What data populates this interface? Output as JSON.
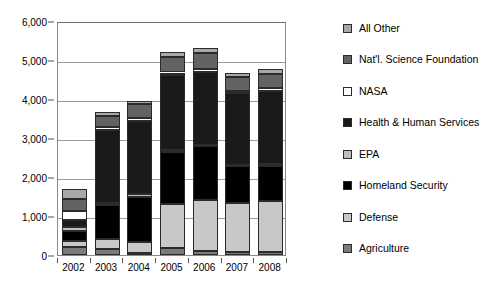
{
  "chart_data": {
    "type": "bar",
    "stacked": true,
    "title": "",
    "xlabel": "",
    "ylabel": "",
    "categories": [
      "2002",
      "2003",
      "2004",
      "2005",
      "2006",
      "2007",
      "2008"
    ],
    "ylim": [
      0,
      6000
    ],
    "yticks": [
      0,
      1000,
      2000,
      3000,
      4000,
      5000,
      6000
    ],
    "ytick_labels": [
      "0",
      "1,000",
      "2,000",
      "3,000",
      "4,000",
      "5,000",
      "6,000"
    ],
    "grid": true,
    "legend_position": "right",
    "series": [
      {
        "name": "Agriculture",
        "color": "#7b7b7b",
        "values": [
          200,
          160,
          60,
          180,
          110,
          80,
          70
        ]
      },
      {
        "name": "Defense",
        "color": "#c8c8c8",
        "values": [
          160,
          260,
          270,
          1130,
          1300,
          1260,
          1320
        ]
      },
      {
        "name": "Homeland Security",
        "color": "#000000",
        "values": [
          260,
          850,
          1170,
          1340,
          1380,
          930,
          900
        ]
      },
      {
        "name": "EPA",
        "color": "#bdbdbd",
        "values": [
          90,
          60,
          60,
          40,
          40,
          40,
          40
        ]
      },
      {
        "name": "Health & Human Services",
        "color": "#1a1a1a",
        "values": [
          190,
          1880,
          1880,
          1930,
          1870,
          1840,
          1880
        ]
      },
      {
        "name": "NASA",
        "color": "#ffffff",
        "values": [
          230,
          60,
          80,
          60,
          60,
          60,
          60
        ]
      },
      {
        "name": "Nat'l. Science Foundation",
        "color": "#636363",
        "values": [
          310,
          290,
          340,
          400,
          410,
          350,
          370
        ]
      },
      {
        "name": "All Other",
        "color": "#a8a8a8",
        "values": [
          240,
          100,
          100,
          130,
          130,
          120,
          130
        ]
      }
    ]
  },
  "legend": {
    "items": [
      {
        "label": "All Other",
        "color": "#a8a8a8"
      },
      {
        "label": "Nat'l. Science Foundation",
        "color": "#636363"
      },
      {
        "label": "NASA",
        "color": "#ffffff"
      },
      {
        "label": "Health & Human Services",
        "color": "#1a1a1a"
      },
      {
        "label": "EPA",
        "color": "#bdbdbd"
      },
      {
        "label": "Homeland Security",
        "color": "#000000"
      },
      {
        "label": "Defense",
        "color": "#c8c8c8"
      },
      {
        "label": "Agriculture",
        "color": "#7b7b7b"
      }
    ]
  }
}
